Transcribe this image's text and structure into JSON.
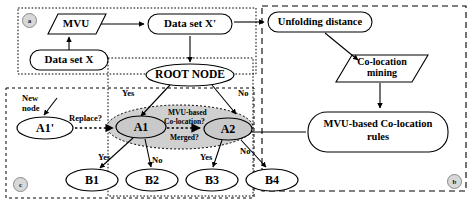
{
  "figure": {
    "background": "#ffffff",
    "stroke": "#000000",
    "shade_fill": "#d0d0d0"
  },
  "panels": [
    {
      "tag": "a",
      "name": "panel-a",
      "label": "a"
    },
    {
      "tag": "b",
      "name": "panel-b",
      "label": "b"
    },
    {
      "tag": "c",
      "name": "panel-c",
      "label": "c"
    }
  ],
  "nodes": {
    "mvu": {
      "label": "MVU",
      "shape": "parallelogram"
    },
    "data_set_x": {
      "label": "Data set X",
      "shape": "rounded-rect"
    },
    "data_set_x_prime": {
      "label": "Data set X'",
      "shape": "rounded-rect"
    },
    "unfolding_distance": {
      "label": "Unfolding distance",
      "shape": "rounded-rect"
    },
    "colocation_mining": {
      "label": "Co-location\nmining",
      "line1": "Co-location",
      "line2": "mining",
      "shape": "parallelogram"
    },
    "colocation_rules": {
      "label": "MVU-based Co-location\nrules",
      "line1": "MVU-based Co-location",
      "line2": "rules",
      "shape": "rounded-rect"
    },
    "root_node": {
      "label": "ROOT NODE",
      "shape": "ellipse"
    },
    "a1_prime": {
      "label": "A1'",
      "shape": "ellipse"
    },
    "a1": {
      "label": "A1",
      "shape": "ellipse"
    },
    "a2": {
      "label": "A2",
      "shape": "ellipse"
    },
    "b1": {
      "label": "B1",
      "shape": "ellipse"
    },
    "b2": {
      "label": "B2",
      "shape": "ellipse"
    },
    "b3": {
      "label": "B3",
      "shape": "ellipse"
    },
    "b4": {
      "label": "B4",
      "shape": "ellipse"
    }
  },
  "edge_labels": {
    "new_node_line1": "New",
    "new_node_line2": "node",
    "replace": "Replace?",
    "root_yes": "Yes",
    "root_no": "No",
    "a1_yes": "Yes",
    "a1_no": "No",
    "a2_yes": "Yes",
    "a2_no": "No",
    "merge_line1": "MVU-based",
    "merge_line2": "Co-location?",
    "merge_line3": "Merged?"
  }
}
